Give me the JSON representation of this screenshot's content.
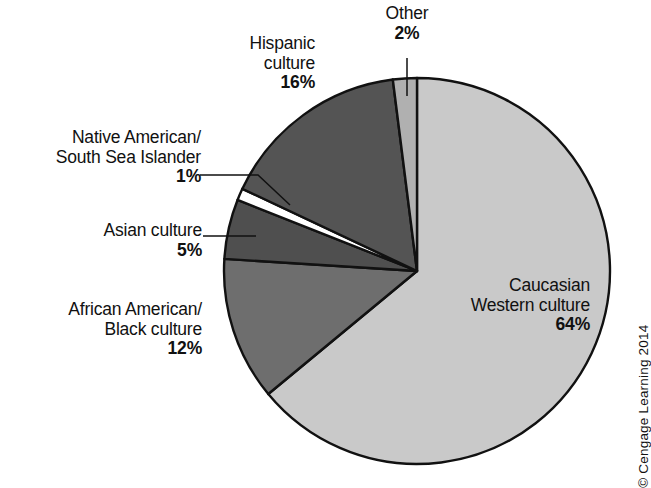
{
  "chart_data": {
    "type": "pie",
    "title": "",
    "categories": [
      "Caucasian Western culture",
      "African American/ Black culture",
      "Asian culture",
      "Native American/ South Sea Islander",
      "Hispanic culture",
      "Other"
    ],
    "values": [
      64,
      12,
      5,
      1,
      16,
      2
    ],
    "value_unit": "%",
    "start_angle_deg": -90,
    "direction": "clockwise",
    "legend": "none (direct labels with leader lines)",
    "grid": false,
    "slices": [
      {
        "key": "caucasian",
        "name": "Caucasian",
        "name_line2": "Western culture",
        "value": 64,
        "value_label": "64%",
        "color": "#c9c9c9",
        "label_placement": "inside-right",
        "leader": false
      },
      {
        "key": "african",
        "name": "African American/",
        "name_line2": "Black culture",
        "value": 12,
        "value_label": "12%",
        "color": "#6e6e6e",
        "label_placement": "outside-left",
        "leader": false
      },
      {
        "key": "asian",
        "name": "Asian culture",
        "name_line2": "",
        "value": 5,
        "value_label": "5%",
        "color": "#4f4f4f",
        "label_placement": "outside-left",
        "leader": true
      },
      {
        "key": "native",
        "name": "Native American/",
        "name_line2": "South Sea Islander",
        "value": 1,
        "value_label": "1%",
        "color": "#ffffff",
        "label_placement": "outside-left",
        "leader": true
      },
      {
        "key": "hispanic",
        "name": "Hispanic",
        "name_line2": "culture",
        "value": 16,
        "value_label": "16%",
        "color": "#545454",
        "label_placement": "outside-top-left",
        "leader": false
      },
      {
        "key": "other",
        "name": "Other",
        "name_line2": "",
        "value": 2,
        "value_label": "2%",
        "color": "#b0b0b0",
        "label_placement": "outside-top",
        "leader": true
      }
    ],
    "colors": {
      "caucasian": "#c9c9c9",
      "african": "#6e6e6e",
      "asian": "#4f4f4f",
      "native": "#ffffff",
      "hispanic": "#545454",
      "other": "#b0b0b0",
      "outline": "#111111",
      "background": "#ffffff"
    }
  },
  "footer": {
    "copyright": "© Cengage Learning 2014"
  }
}
